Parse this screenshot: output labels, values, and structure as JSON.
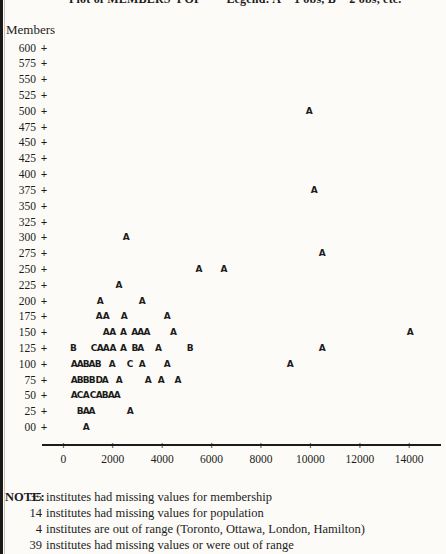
{
  "page": {
    "background": "#fcfbf7",
    "ink": "#1c1c1c"
  },
  "title": {
    "text": "Plot of MEMBERS*POP        Legend: A = 1 obs, B = 2 obs, etc."
  },
  "chart_data": {
    "type": "scatter",
    "title": "Plot of MEMBERS*POP",
    "legend": "A = 1 obs, B = 2 obs, etc.",
    "ylabel": "Members",
    "xlabel": "",
    "grid": false,
    "x_axis": {
      "labels": [
        "0",
        "2000",
        "4000",
        "6000",
        "8000",
        "10000",
        "12000",
        "14000"
      ],
      "values": [
        0,
        2000,
        4000,
        6000,
        8000,
        10000,
        12000,
        14000
      ],
      "xlim": [
        0,
        14000
      ]
    },
    "y_axis": {
      "labels": [
        "600",
        "575",
        "550",
        "525",
        "500",
        "475",
        "450",
        "425",
        "400",
        "375",
        "350",
        "325",
        "300",
        "275",
        "250",
        "225",
        "200",
        "175",
        "150",
        "125",
        "100",
        "75",
        "50",
        "25",
        "00"
      ],
      "values": [
        600,
        575,
        550,
        525,
        500,
        475,
        450,
        425,
        400,
        375,
        350,
        325,
        300,
        275,
        250,
        225,
        200,
        175,
        150,
        125,
        100,
        75,
        50,
        25,
        0
      ],
      "ylim": [
        0,
        600
      ]
    },
    "points": [
      {
        "pop": 9950,
        "members": 500,
        "symbol": "A"
      },
      {
        "pop": 10150,
        "members": 375,
        "symbol": "A"
      },
      {
        "pop": 2540,
        "members": 300,
        "symbol": "A"
      },
      {
        "pop": 10470,
        "members": 275,
        "symbol": "A"
      },
      {
        "pop": 5490,
        "members": 250,
        "symbol": "A"
      },
      {
        "pop": 6500,
        "members": 250,
        "symbol": "A"
      },
      {
        "pop": 2250,
        "members": 225,
        "symbol": "A"
      },
      {
        "pop": 1490,
        "members": 200,
        "symbol": "A"
      },
      {
        "pop": 3190,
        "members": 200,
        "symbol": "A"
      },
      {
        "pop": 1450,
        "members": 175,
        "symbol": "A"
      },
      {
        "pop": 1730,
        "members": 175,
        "symbol": "A"
      },
      {
        "pop": 2460,
        "members": 175,
        "symbol": "A"
      },
      {
        "pop": 4200,
        "members": 175,
        "symbol": "A"
      },
      {
        "pop": 1730,
        "members": 150,
        "symbol": "A"
      },
      {
        "pop": 1990,
        "members": 150,
        "symbol": "A"
      },
      {
        "pop": 2430,
        "members": 150,
        "symbol": "A"
      },
      {
        "pop": 2890,
        "members": 150,
        "symbol": "A"
      },
      {
        "pop": 3130,
        "members": 150,
        "symbol": "A"
      },
      {
        "pop": 3380,
        "members": 150,
        "symbol": "A"
      },
      {
        "pop": 4450,
        "members": 150,
        "symbol": "A"
      },
      {
        "pop": 14030,
        "members": 150,
        "symbol": "A"
      },
      {
        "pop": 405,
        "members": 125,
        "symbol": "B"
      },
      {
        "pop": 1240,
        "members": 125,
        "symbol": "C"
      },
      {
        "pop": 1490,
        "members": 125,
        "symbol": "A"
      },
      {
        "pop": 1730,
        "members": 125,
        "symbol": "A"
      },
      {
        "pop": 2000,
        "members": 125,
        "symbol": "A"
      },
      {
        "pop": 2430,
        "members": 125,
        "symbol": "A"
      },
      {
        "pop": 2890,
        "members": 125,
        "symbol": "B"
      },
      {
        "pop": 3130,
        "members": 125,
        "symbol": "A"
      },
      {
        "pop": 3845,
        "members": 125,
        "symbol": "A"
      },
      {
        "pop": 5130,
        "members": 125,
        "symbol": "B"
      },
      {
        "pop": 10470,
        "members": 125,
        "symbol": "A"
      },
      {
        "pop": 435,
        "members": 100,
        "symbol": "A"
      },
      {
        "pop": 675,
        "members": 100,
        "symbol": "A"
      },
      {
        "pop": 920,
        "members": 100,
        "symbol": "B"
      },
      {
        "pop": 1160,
        "members": 100,
        "symbol": "A"
      },
      {
        "pop": 1405,
        "members": 100,
        "symbol": "B"
      },
      {
        "pop": 1970,
        "members": 100,
        "symbol": "A"
      },
      {
        "pop": 2700,
        "members": 100,
        "symbol": "C"
      },
      {
        "pop": 3185,
        "members": 100,
        "symbol": "A"
      },
      {
        "pop": 4200,
        "members": 100,
        "symbol": "A"
      },
      {
        "pop": 9175,
        "members": 100,
        "symbol": "A"
      },
      {
        "pop": 435,
        "members": 75,
        "symbol": "A"
      },
      {
        "pop": 675,
        "members": 75,
        "symbol": "B"
      },
      {
        "pop": 920,
        "members": 75,
        "symbol": "B"
      },
      {
        "pop": 1160,
        "members": 75,
        "symbol": "B"
      },
      {
        "pop": 1445,
        "members": 75,
        "symbol": "D"
      },
      {
        "pop": 1690,
        "members": 75,
        "symbol": "A"
      },
      {
        "pop": 2255,
        "members": 75,
        "symbol": "A"
      },
      {
        "pop": 3430,
        "members": 75,
        "symbol": "A"
      },
      {
        "pop": 3955,
        "members": 75,
        "symbol": "A"
      },
      {
        "pop": 4640,
        "members": 75,
        "symbol": "A"
      },
      {
        "pop": 435,
        "members": 50,
        "symbol": "A"
      },
      {
        "pop": 675,
        "members": 50,
        "symbol": "C"
      },
      {
        "pop": 920,
        "members": 50,
        "symbol": "A"
      },
      {
        "pop": 1200,
        "members": 50,
        "symbol": "C"
      },
      {
        "pop": 1445,
        "members": 50,
        "symbol": "A"
      },
      {
        "pop": 1690,
        "members": 50,
        "symbol": "B"
      },
      {
        "pop": 1930,
        "members": 50,
        "symbol": "A"
      },
      {
        "pop": 2175,
        "members": 50,
        "symbol": "A"
      },
      {
        "pop": 675,
        "members": 25,
        "symbol": "B"
      },
      {
        "pop": 920,
        "members": 25,
        "symbol": "A"
      },
      {
        "pop": 1160,
        "members": 25,
        "symbol": "A"
      },
      {
        "pop": 2700,
        "members": 25,
        "symbol": "A"
      },
      {
        "pop": 920,
        "members": 0,
        "symbol": "A"
      }
    ]
  },
  "note": {
    "label": "NOTE:",
    "lines": [
      {
        "num": "35",
        "text": "institutes had missing values for membership"
      },
      {
        "num": "14",
        "text": "institutes had missing values for population"
      },
      {
        "num": "4",
        "text": "institutes are out of range (Toronto, Ottawa, London, Hamilton)"
      },
      {
        "num": "39",
        "text": "institutes had missing values or were out of range"
      }
    ]
  }
}
